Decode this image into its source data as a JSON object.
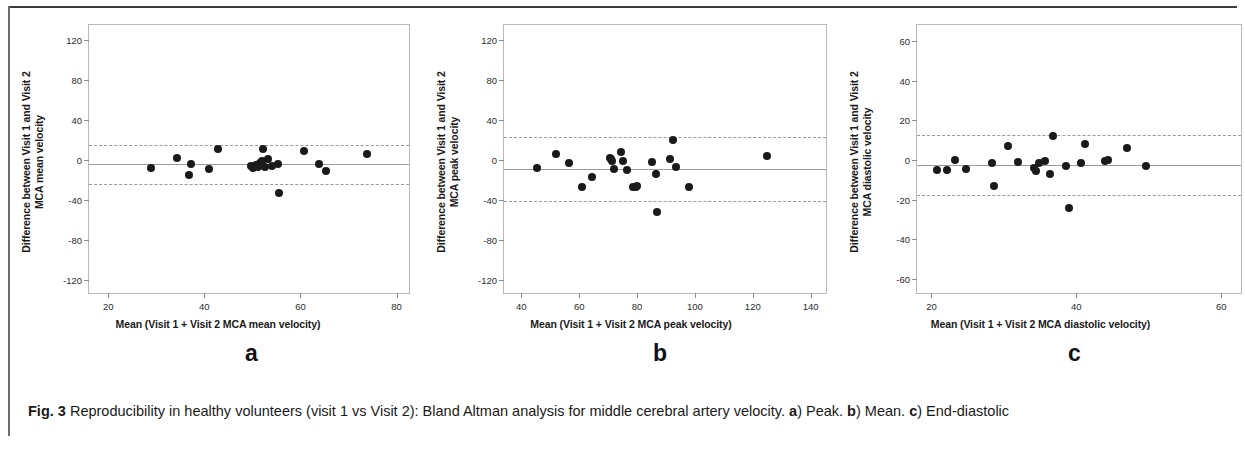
{
  "figure": {
    "caption_prefix": "Fig. 3",
    "caption_text": " Reproducibility in healthy volunteers (visit 1 vs Visit 2): Bland Altman analysis for middle cerebral artery velocity. ",
    "caption_a_marker": "a",
    "caption_a_text": ") Peak. ",
    "caption_b_marker": "b",
    "caption_b_text": ") Mean. ",
    "caption_c_marker": "c",
    "caption_c_text": ") End-diastolic"
  },
  "chart_data": [
    {
      "panel": "a",
      "letter": "a",
      "type": "scatter",
      "title": "",
      "xlabel": "Mean (Visit 1 + Visit 2 MCA mean velocity)",
      "ylabel": "Difference between Visit 1 and Visit 2\nMCA mean velocity",
      "xlim": [
        16,
        83
      ],
      "ylim": [
        -135,
        135
      ],
      "xticks": [
        20,
        40,
        60,
        80
      ],
      "yticks": [
        120,
        80,
        40,
        0,
        -40,
        -80,
        -120
      ],
      "grid": false,
      "reference_lines": [
        {
          "name": "upper-limit-of-agreement",
          "value": 15,
          "style": "dashed"
        },
        {
          "name": "mean-bias",
          "value": -4,
          "style": "solid"
        },
        {
          "name": "lower-limit-of-agreement",
          "value": -24,
          "style": "dashed"
        }
      ],
      "x": [
        29.0,
        34.3,
        36.8,
        37.2,
        41.0,
        42.8,
        49.8,
        50.2,
        50.5,
        50.8,
        51.2,
        51.6,
        52.0,
        52.2,
        52.6,
        53.2,
        54.0,
        55.4,
        55.6,
        60.8,
        63.8,
        65.3,
        73.8
      ],
      "y": [
        -7.5,
        2.5,
        -15.0,
        -3.5,
        -8.5,
        11.0,
        -6.0,
        -7.5,
        -5.5,
        -4.5,
        -6.5,
        -3.0,
        -1.0,
        11.0,
        -7.0,
        1.5,
        -5.5,
        -4.0,
        -33.0,
        9.5,
        -3.5,
        -10.5,
        6.0
      ]
    },
    {
      "panel": "b",
      "letter": "b",
      "type": "scatter",
      "title": "",
      "xlabel": "Mean (Visit 1 + Visit 2 MCA peak velocity)",
      "ylabel": "Difference between Visit 1 and Visit 2\nMCA peak velocity",
      "xlim": [
        34,
        146
      ],
      "ylim": [
        -135,
        135
      ],
      "xticks": [
        40,
        60,
        80,
        100,
        120,
        140
      ],
      "yticks": [
        120,
        80,
        40,
        0,
        -40,
        -80,
        -120
      ],
      "grid": false,
      "reference_lines": [
        {
          "name": "upper-limit-of-agreement",
          "value": 23,
          "style": "dashed"
        },
        {
          "name": "mean-bias",
          "value": -9,
          "style": "solid"
        },
        {
          "name": "lower-limit-of-agreement",
          "value": -41,
          "style": "dashed"
        }
      ],
      "x": [
        45.5,
        52.0,
        56.5,
        61.0,
        64.5,
        70.5,
        71.0,
        71.5,
        72.0,
        74.5,
        75.0,
        76.5,
        78.5,
        79.5,
        80.0,
        85.0,
        86.5,
        87.0,
        91.5,
        92.5,
        93.5,
        98.0,
        125.0
      ],
      "y": [
        -8.0,
        6.5,
        -2.5,
        -27.0,
        -16.5,
        2.5,
        1.5,
        -0.5,
        -9.0,
        8.0,
        -1.0,
        -10.0,
        -27.0,
        -26.5,
        -26.0,
        -2.0,
        -13.5,
        -52.0,
        1.0,
        20.5,
        -6.5,
        -27.0,
        4.5
      ]
    },
    {
      "panel": "c",
      "letter": "c",
      "type": "scatter",
      "title": "",
      "xlabel": "Mean (Visit 1 + Visit 2 MCA diastolic velocity)",
      "ylabel": "Difference between Visit 1 and Visit 2\nMCA diastolic velocity",
      "xlim": [
        18,
        63
      ],
      "ylim": [
        -68,
        68
      ],
      "xticks": [
        20,
        40,
        60
      ],
      "yticks": [
        60,
        40,
        20,
        0,
        -20,
        -40,
        -60
      ],
      "grid": false,
      "reference_lines": [
        {
          "name": "upper-limit-of-agreement",
          "value": 12.5,
          "style": "dashed"
        },
        {
          "name": "mean-bias",
          "value": -2.5,
          "style": "solid"
        },
        {
          "name": "lower-limit-of-agreement",
          "value": -17.5,
          "style": "dashed"
        }
      ],
      "x": [
        20.7,
        22.2,
        23.2,
        24.8,
        28.3,
        28.6,
        30.6,
        31.9,
        34.2,
        34.4,
        34.9,
        35.6,
        36.4,
        36.8,
        38.6,
        39.0,
        40.6,
        41.2,
        44.0,
        44.4,
        47.0,
        49.6
      ],
      "y": [
        -5.0,
        -5.0,
        0.0,
        -4.5,
        -1.5,
        -13.0,
        7.0,
        -1.0,
        -4.0,
        -5.5,
        -1.5,
        -0.5,
        -7.0,
        12.0,
        -3.0,
        -24.0,
        -1.5,
        8.0,
        -0.5,
        0.0,
        6.0,
        -3.0
      ]
    }
  ]
}
